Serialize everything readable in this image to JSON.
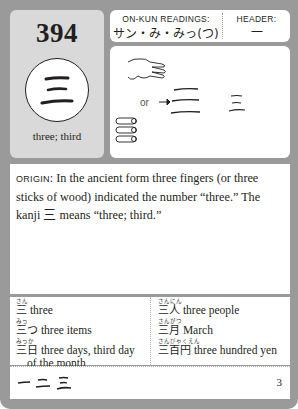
{
  "card": {
    "number": "394",
    "kanji": "三",
    "meaning": "three; third",
    "readings_label": "ON-KUN READINGS:",
    "readings_value": "サン・み・みっ(つ)",
    "header_label": "HEADER:",
    "header_value": "一",
    "art": {
      "or_label": "or",
      "icons": [
        "hand-three-fingers-icon",
        "three-sticks-icon",
        "arrow-right-icon",
        "ancient-three-icon",
        "modern-three-icon"
      ]
    },
    "origin": {
      "label": "ORIGIN",
      "text_part1": ": In the ancient form three fingers (or three sticks of wood) indicated the number “three.” The kanji ",
      "kanji": "三",
      "text_part2": " means “three; third.”"
    },
    "vocab_left": [
      {
        "furigana": "さん",
        "word": "三",
        "meaning": "three"
      },
      {
        "furigana": "みっ",
        "word": "三つ",
        "meaning": "three items"
      },
      {
        "furigana": "みっか",
        "word": "三日",
        "meaning": "three days, third day",
        "meaning_cont": "of the month"
      }
    ],
    "vocab_right": [
      {
        "furigana": "さんにん",
        "word": "三人",
        "meaning": "three people"
      },
      {
        "furigana": "さんがつ",
        "word": "三月",
        "meaning": "March"
      },
      {
        "furigana": "さんびゃくえん",
        "word": "三百円",
        "meaning": "three hundred yen"
      }
    ],
    "stroke_order": [
      "一",
      "二",
      "三"
    ],
    "stroke_count": "3"
  }
}
